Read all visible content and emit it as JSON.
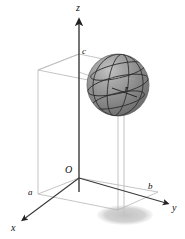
{
  "figure": {
    "background_color": "#ffffff"
  },
  "axes": {
    "z": {
      "label": "z",
      "label_x": 76,
      "label_y": 11
    },
    "x": {
      "label": "x",
      "label_x": 11,
      "label_y": 231
    },
    "y": {
      "label": "y",
      "label_x": 172,
      "label_y": 211
    }
  },
  "origin": {
    "label": "O",
    "label_x": 65,
    "label_y": 173
  },
  "dimensions": {
    "a": {
      "label": "a",
      "label_x": 28,
      "label_y": 195
    },
    "b": {
      "label": "b",
      "label_x": 148,
      "label_y": 189
    },
    "c": {
      "label": "c",
      "label_x": 82,
      "label_y": 54
    }
  },
  "sphere": {
    "radius_label": "r",
    "radius_label_x": 125,
    "radius_label_y": 91,
    "center_x": 118,
    "center_y": 85,
    "radius_px": 31,
    "fill_color": "#8d8d8d",
    "highlight_color": "#b9b9b9",
    "shade_color": "#6e6e6e",
    "grid_color": "#2a2a2a"
  },
  "shadow": {
    "center_x": 125,
    "center_y": 215,
    "rx": 28,
    "ry": 10,
    "color": "#c9c9c9"
  },
  "colors": {
    "axis_stroke": "#3a3a3a",
    "box_stroke": "#b4b4b4",
    "drop_line": "#bdbdbd",
    "label_text": "#111111"
  }
}
